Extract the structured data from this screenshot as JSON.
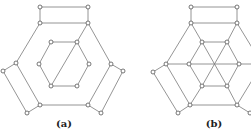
{
  "figures": [
    {
      "id": "a",
      "label": "(a)",
      "nodes": {
        "t1": [
          40,
          7
        ],
        "t2": [
          88,
          7
        ],
        "o1": [
          40,
          23
        ],
        "o2": [
          88,
          23
        ],
        "o3": [
          111,
          64
        ],
        "o4": [
          88,
          105
        ],
        "o5": [
          40,
          105
        ],
        "o6": [
          16,
          63
        ],
        "i1": [
          51,
          42
        ],
        "i2": [
          77,
          42
        ],
        "i3": [
          89,
          64
        ],
        "i4": [
          77,
          86
        ],
        "i5": [
          51,
          86
        ],
        "i6": [
          39,
          64
        ],
        "r1": [
          123,
          71
        ],
        "r2": [
          101,
          113
        ],
        "l1": [
          3,
          71
        ],
        "l2": [
          27,
          113
        ]
      },
      "edges": [
        [
          "t1",
          "t2"
        ],
        [
          "t1",
          "o1"
        ],
        [
          "t2",
          "o2"
        ],
        [
          "o1",
          "o2"
        ],
        [
          "o2",
          "o3"
        ],
        [
          "o5",
          "o4"
        ],
        [
          "o6",
          "o1"
        ],
        [
          "o6",
          "o5"
        ],
        [
          "o3",
          "o4"
        ],
        [
          "i1",
          "i2"
        ],
        [
          "i2",
          "i3"
        ],
        [
          "i3",
          "i4"
        ],
        [
          "i4",
          "i5"
        ],
        [
          "i5",
          "i6"
        ],
        [
          "i6",
          "i1"
        ],
        [
          "o2",
          "i5"
        ],
        [
          "o3",
          "r1"
        ],
        [
          "r1",
          "r2"
        ],
        [
          "r2",
          "o4"
        ],
        [
          "o6",
          "l1"
        ],
        [
          "l1",
          "l2"
        ],
        [
          "l2",
          "o5"
        ]
      ]
    },
    {
      "id": "b",
      "label": "(b)",
      "nodes": {
        "t1": [
          191,
          7
        ],
        "t2": [
          237,
          7
        ],
        "o1": [
          191,
          23
        ],
        "o2": [
          237,
          23
        ],
        "o3": [
          262,
          64
        ],
        "o4": [
          237,
          105
        ],
        "o5": [
          190,
          105
        ],
        "o6": [
          166,
          64
        ],
        "i1": [
          202,
          42
        ],
        "i2": [
          227,
          42
        ],
        "i3": [
          239,
          64
        ],
        "i4": [
          227,
          86
        ],
        "i5": [
          202,
          86
        ],
        "i6": [
          189,
          64
        ],
        "r1": [
          250,
          113
        ],
        "l1": [
          153,
          72
        ],
        "l2": [
          178,
          113
        ]
      },
      "edges": [
        [
          "t1",
          "t2"
        ],
        [
          "t1",
          "o1"
        ],
        [
          "t2",
          "o2"
        ],
        [
          "o1",
          "o2"
        ],
        [
          "o2",
          "o3"
        ],
        [
          "o5",
          "o4"
        ],
        [
          "o6",
          "o1"
        ],
        [
          "o6",
          "o5"
        ],
        [
          "o3",
          "o4"
        ],
        [
          "i1",
          "i2"
        ],
        [
          "i2",
          "i3"
        ],
        [
          "i3",
          "i4"
        ],
        [
          "i4",
          "i5"
        ],
        [
          "i5",
          "i6"
        ],
        [
          "i6",
          "i1"
        ],
        [
          "o1",
          "i1"
        ],
        [
          "o2",
          "i2"
        ],
        [
          "o5",
          "i5"
        ],
        [
          "o4",
          "i4"
        ],
        [
          "o6",
          "o3"
        ],
        [
          "i1",
          "i4"
        ],
        [
          "i2",
          "i5"
        ],
        [
          "o4",
          "r1"
        ],
        [
          "o6",
          "l1"
        ],
        [
          "l1",
          "l2"
        ],
        [
          "l2",
          "o5"
        ]
      ]
    }
  ]
}
